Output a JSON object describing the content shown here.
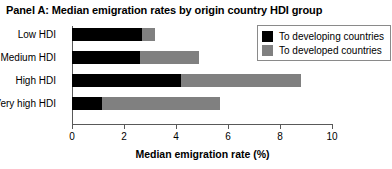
{
  "panel": {
    "title": "Panel A: Median emigration rates by origin country HDI group"
  },
  "legend": {
    "position": "top-right",
    "items": [
      {
        "label": "To developing countries",
        "color": "#000000",
        "swatch_name": "legend-swatch-developing"
      },
      {
        "label": "To developed countries",
        "color": "#808080",
        "swatch_name": "legend-swatch-developed"
      }
    ]
  },
  "chart_data": {
    "type": "bar",
    "orientation": "horizontal",
    "stacked": true,
    "title": "Panel A: Median emigration rates by origin country HDI group",
    "xlabel": "Median emigration rate (%)",
    "ylabel": "",
    "xlim": [
      0,
      10
    ],
    "xticks": [
      0,
      2,
      4,
      6,
      8,
      10
    ],
    "xtick_labels": [
      "0",
      "2",
      "4",
      "6",
      "8",
      "10"
    ],
    "grid": false,
    "legend_position": "top-right",
    "categories": [
      "Low HDI",
      "Medium HDI",
      "High HDI",
      "Very high HDI"
    ],
    "series": [
      {
        "name": "To developing countries",
        "color": "#000000",
        "values": [
          2.7,
          2.6,
          4.2,
          1.15
        ]
      },
      {
        "name": "To developed countries",
        "color": "#808080",
        "values": [
          0.5,
          2.3,
          4.6,
          4.55
        ]
      }
    ],
    "totals": [
      3.2,
      4.9,
      8.8,
      5.7
    ]
  }
}
